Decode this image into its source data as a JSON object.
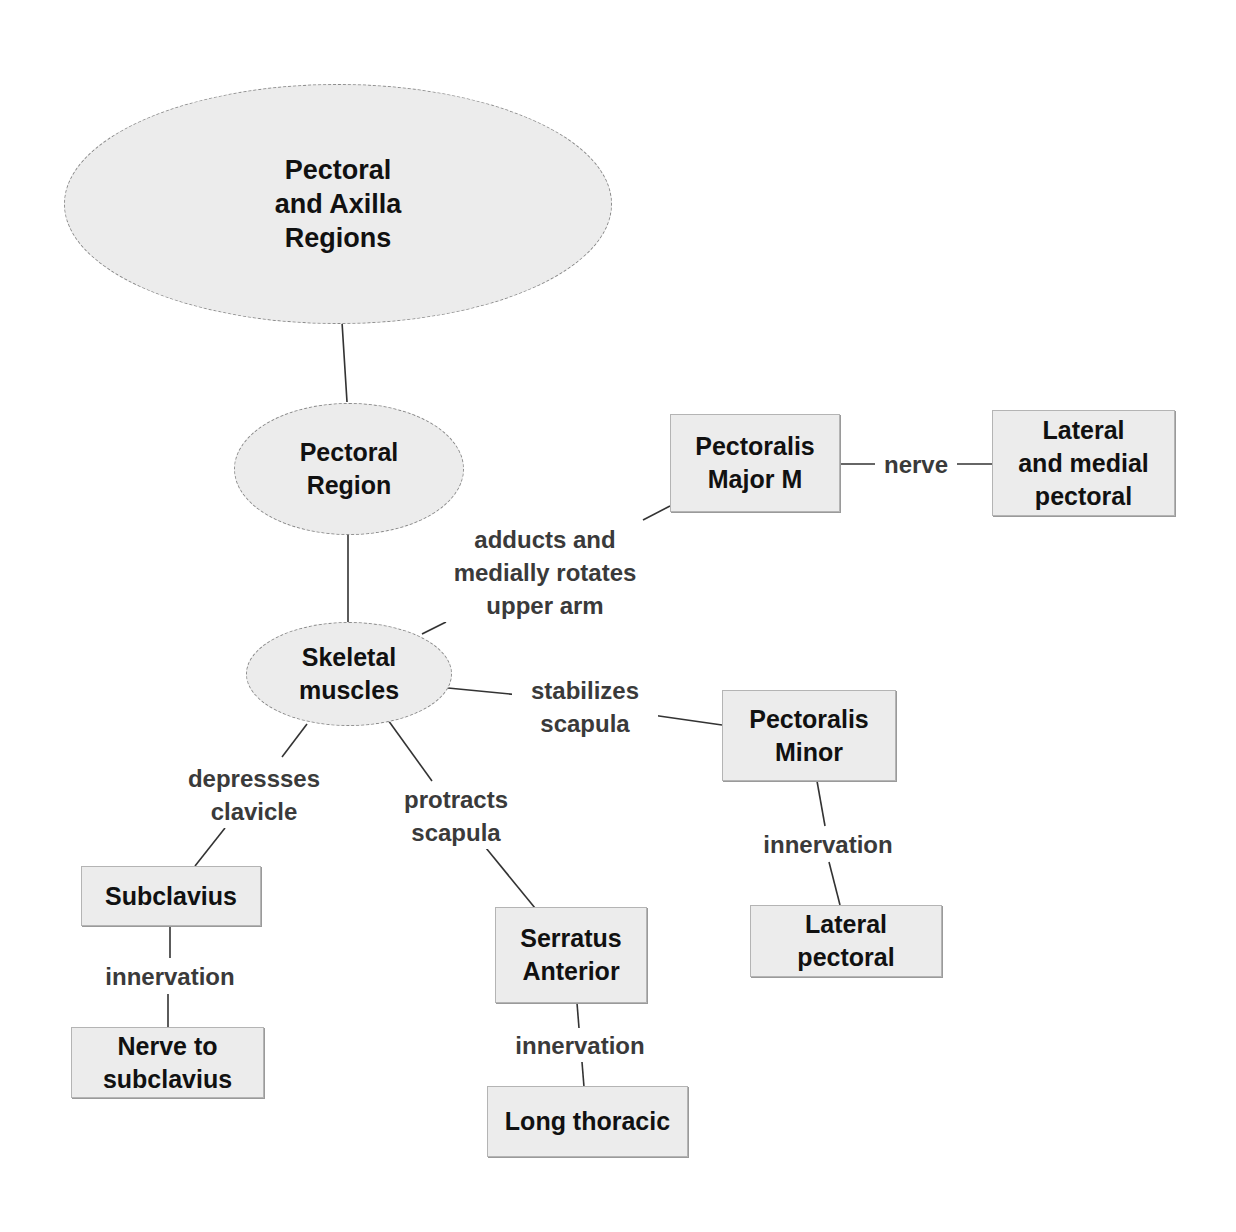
{
  "diagram": {
    "type": "concept-map",
    "colors": {
      "node_fill": "#ececec",
      "edge_stroke": "#333333",
      "node_text": "#111111",
      "label_text": "#3a3a3a"
    },
    "nodes": {
      "root": "Pectoral\nand Axilla\nRegions",
      "pectoral_region": "Pectoral\nRegion",
      "skeletal_muscles": "Skeletal\nmuscles",
      "pectoralis_major": "Pectoralis\nMajor M",
      "lateral_medial_pectoral": "Lateral\nand medial\npectoral",
      "pectoralis_minor": "Pectoralis\nMinor",
      "lateral_pectoral": "Lateral\npectoral",
      "subclavius": "Subclavius",
      "nerve_to_subclavius": "Nerve to\nsubclavius",
      "serratus_anterior": "Serratus\nAnterior",
      "long_thoracic": "Long thoracic"
    },
    "edge_labels": {
      "adducts": "adducts and\nmedially rotates\nupper arm",
      "nerve": "nerve",
      "stabilizes": "stabilizes\nscapula",
      "depresses": "depressses\nclavicle",
      "protracts": "protracts\nscapula",
      "innervation_minor": "innervation",
      "innervation_subclavius": "innervation",
      "innervation_serratus": "innervation"
    }
  }
}
